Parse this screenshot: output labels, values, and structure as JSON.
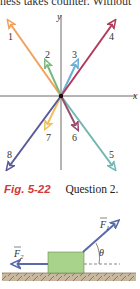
{
  "header": {
    "partial_text": "ness takes counter. Without"
  },
  "figure_1": {
    "axes": {
      "x_label": "x",
      "y_label": "y"
    },
    "vectors": [
      {
        "label": "1",
        "color": "#f2a15a"
      },
      {
        "label": "2",
        "color": "#7cb87e"
      },
      {
        "label": "3",
        "color": "#6aaed6"
      },
      {
        "label": "4",
        "color": "#b23a5a"
      },
      {
        "label": "5",
        "color": "#6fb8b0"
      },
      {
        "label": "6",
        "color": "#9a4a6e"
      },
      {
        "label": "7",
        "color": "#f0c060"
      },
      {
        "label": "8",
        "color": "#5a5a9a"
      }
    ]
  },
  "caption": {
    "figure_label": "Fig. 5-22",
    "text": "Question 2."
  },
  "figure_2": {
    "force_1": "F1",
    "force_2": "F2",
    "angle": "θ",
    "block_color": "#a8d38a",
    "arrow_color": "#5a6aa8",
    "ground_color": "#b8a890"
  }
}
